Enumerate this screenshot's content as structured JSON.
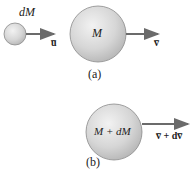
{
  "panel_a": {
    "small_mass_label": "dM",
    "big_mass_label": "M",
    "small_velocity_label": "u̅",
    "big_velocity_label": "v̅",
    "caption": "(a)"
  },
  "panel_b": {
    "mass_label": "M + dM",
    "velocity_label": "v̅ + dv̅",
    "caption": "(b)"
  },
  "colors": {
    "sphere_fill": "#d4d4d4",
    "sphere_edge": "#8a8a8a",
    "arrow": "#6b6b6b",
    "text": "#222222"
  }
}
